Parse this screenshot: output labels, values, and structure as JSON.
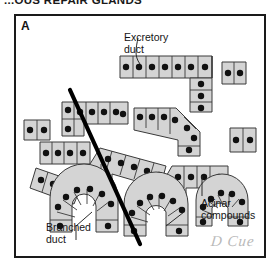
{
  "figure": {
    "title": "...OUS REPAIR GLANDS",
    "panel_letter": "A",
    "signature": "D Cue",
    "border_color": "#1a1a1a",
    "background_color": "#ffffff"
  },
  "labels": {
    "excretory_duct_line1": "Excretory",
    "excretory_duct_line2": "duct",
    "acinar_line1": "Acinar",
    "acinar_line2": "compounds",
    "branched_line1": "Branched",
    "branched_line2": "duct"
  },
  "diagram": {
    "cell_fill": "#d4d4d4",
    "cell_stroke": "#3a3a3a",
    "nucleus_color": "#111111",
    "lumen_color": "#ffffff",
    "section_line_color": "#000000",
    "leader_line_color": "#2b2b2b",
    "structures": [
      "excretory duct",
      "branched duct",
      "acinar compounds"
    ]
  }
}
